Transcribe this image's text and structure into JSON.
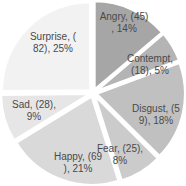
{
  "chart_data": {
    "type": "pie",
    "title": "",
    "start_angle_deg": 0,
    "direction": "clockwise",
    "exploded": true,
    "categories": [
      "Angry",
      "Contempt",
      "Disgust",
      "Fear",
      "Happy",
      "Sad",
      "Surprise"
    ],
    "values": [
      45,
      18,
      59,
      25,
      69,
      28,
      82
    ],
    "percentages": [
      14,
      5,
      18,
      8,
      21,
      9,
      25
    ],
    "labels": [
      {
        "line1": "Angry, (45)",
        "line2": ", 14%"
      },
      {
        "line1": "Contempt,",
        "line2": "(18), 5%"
      },
      {
        "line1": "Disgust, (5",
        "line2": "9), 18%"
      },
      {
        "line1": "Fear, (25),",
        "line2": "8%"
      },
      {
        "line1": "Happy, (69",
        "line2": "), 21%"
      },
      {
        "line1": "Sad, (28),",
        "line2": "9%"
      },
      {
        "line1": "Surprise, (",
        "line2": "82), 25%"
      }
    ],
    "colors": [
      "#a6a6a6",
      "#b4b4b4",
      "#c0c0c0",
      "#cbcbcb",
      "#d9d9d9",
      "#e6e6e6",
      "#f2f2f2"
    ],
    "legend": "none"
  }
}
